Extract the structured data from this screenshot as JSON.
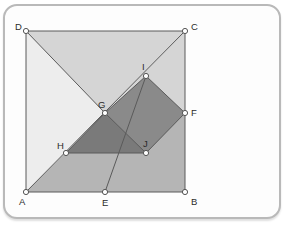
{
  "figure": {
    "frame": {
      "style": "rounded-card",
      "border_color": "#b9b9b9",
      "background_color": "#fdfdfd"
    },
    "colors": {
      "region_light": "#ededed",
      "region_upper": "#d5d5d5",
      "region_lower": "#b5b5b5",
      "quad_fill": "#8a8a8a",
      "triangle_fill": "#7a7a7a",
      "stroke": "#5a5a5a",
      "point_fill": "#ffffff",
      "point_stroke": "#555555",
      "label_color": "#2b2b2b",
      "page_background": "#ffffff"
    },
    "points": [
      {
        "name": "A",
        "label": "A",
        "x": 26,
        "y": 192,
        "label_x": 19,
        "label_y": 205
      },
      {
        "name": "B",
        "label": "B",
        "x": 185,
        "y": 192,
        "label_x": 191,
        "label_y": 205
      },
      {
        "name": "C",
        "label": "C",
        "x": 185,
        "y": 31,
        "label_x": 191,
        "label_y": 30
      },
      {
        "name": "D",
        "label": "D",
        "x": 26,
        "y": 31,
        "label_x": 15,
        "label_y": 30
      },
      {
        "name": "E",
        "label": "E",
        "x": 105,
        "y": 192,
        "label_x": 102,
        "label_y": 206
      },
      {
        "name": "F",
        "label": "F",
        "x": 185,
        "y": 113,
        "label_x": 191,
        "label_y": 116
      },
      {
        "name": "G",
        "label": "G",
        "x": 105,
        "y": 113,
        "label_x": 98,
        "label_y": 108
      },
      {
        "name": "H",
        "label": "H",
        "x": 66,
        "y": 153,
        "label_x": 57,
        "label_y": 149
      },
      {
        "name": "I",
        "label": "I",
        "x": 146,
        "y": 76,
        "label_x": 142,
        "label_y": 70
      },
      {
        "name": "J",
        "label": "J",
        "x": 146,
        "y": 153,
        "label_x": 143,
        "label_y": 147
      }
    ],
    "regions": [
      {
        "name": "region-ADG-light",
        "vertices": "A,D,G",
        "fill": "#ededed"
      },
      {
        "name": "region-DCG-upper",
        "vertices": "D,C,G",
        "fill": "#d5d5d5"
      },
      {
        "name": "region-ABCG-lower",
        "vertices": "A,G,F,C,B",
        "fill": "#b5b5b5"
      },
      {
        "name": "quad-GIFJ",
        "vertices": "G,I,F,J",
        "fill": "#8a8a8a"
      },
      {
        "name": "triangle-GHJ",
        "vertices": "G,H,J",
        "fill": "#7a7a7a"
      }
    ],
    "segments": [
      {
        "name": "side-AB",
        "from": "A",
        "to": "B"
      },
      {
        "name": "side-BC",
        "from": "B",
        "to": "C"
      },
      {
        "name": "side-CD",
        "from": "C",
        "to": "D"
      },
      {
        "name": "side-DA",
        "from": "D",
        "to": "A"
      },
      {
        "name": "diagonal-AC",
        "from": "A",
        "to": "C"
      },
      {
        "name": "diagonal-DG-B",
        "from": "D",
        "to": "B"
      },
      {
        "name": "segment-EI",
        "from": "E",
        "to": "I"
      },
      {
        "name": "segment-GI",
        "from": "G",
        "to": "I"
      },
      {
        "name": "segment-IF",
        "from": "I",
        "to": "F"
      },
      {
        "name": "segment-FJ",
        "from": "F",
        "to": "J"
      },
      {
        "name": "segment-JG",
        "from": "J",
        "to": "G"
      },
      {
        "name": "segment-GH",
        "from": "G",
        "to": "H"
      },
      {
        "name": "segment-HJ",
        "from": "H",
        "to": "J"
      }
    ]
  }
}
